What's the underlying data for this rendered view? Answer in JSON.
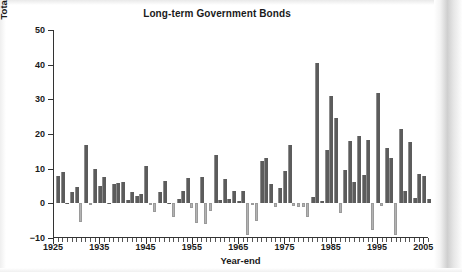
{
  "chart_data": {
    "type": "bar",
    "title": "Long-term Government Bonds",
    "xlabel": "Year-end",
    "ylabel": "Total annual returns (in percent)",
    "ylim": [
      -10,
      50
    ],
    "yticks": [
      -10,
      0,
      10,
      20,
      30,
      40,
      50
    ],
    "ytick_labels": [
      "−10",
      "0",
      "10",
      "20",
      "30",
      "40",
      "50"
    ],
    "xlim": [
      1925,
      2006
    ],
    "xticks": [
      1925,
      1935,
      1945,
      1955,
      1965,
      1975,
      1985,
      1995,
      2005
    ],
    "xtick_labels": [
      "1925",
      "1935",
      "1945",
      "1955",
      "1965",
      "1975",
      "1985",
      "1995",
      "2005"
    ],
    "grid": false,
    "legend": null,
    "bar_color_positive": "#5c5c5c",
    "bar_color_negative": "#b3b3b3",
    "categories": [
      1926,
      1927,
      1928,
      1929,
      1930,
      1931,
      1932,
      1933,
      1934,
      1935,
      1936,
      1937,
      1938,
      1939,
      1940,
      1941,
      1942,
      1943,
      1944,
      1945,
      1946,
      1947,
      1948,
      1949,
      1950,
      1951,
      1952,
      1953,
      1954,
      1955,
      1956,
      1957,
      1958,
      1959,
      1960,
      1961,
      1962,
      1963,
      1964,
      1965,
      1966,
      1967,
      1968,
      1969,
      1970,
      1971,
      1972,
      1973,
      1974,
      1975,
      1976,
      1977,
      1978,
      1979,
      1980,
      1981,
      1982,
      1983,
      1984,
      1985,
      1986,
      1987,
      1988,
      1989,
      1990,
      1991,
      1992,
      1993,
      1994,
      1995,
      1996,
      1997,
      1998,
      1999,
      2000,
      2001,
      2002,
      2003,
      2004,
      2005,
      2006
    ],
    "values": [
      7.8,
      8.9,
      0.1,
      3.4,
      4.7,
      -5.3,
      16.8,
      -0.1,
      10.0,
      5.0,
      7.5,
      0.2,
      5.5,
      5.9,
      6.1,
      0.9,
      3.2,
      2.1,
      2.8,
      10.7,
      -0.1,
      -2.6,
      3.4,
      6.5,
      0.1,
      -3.9,
      1.2,
      3.6,
      7.2,
      -1.3,
      -5.6,
      7.5,
      -6.1,
      -2.3,
      13.8,
      1.0,
      6.9,
      1.2,
      3.5,
      0.7,
      3.7,
      -9.2,
      -0.3,
      -5.1,
      12.1,
      13.2,
      5.7,
      -1.1,
      4.4,
      9.2,
      16.8,
      -0.7,
      -1.2,
      -1.2,
      -4.0,
      1.9,
      40.4,
      0.7,
      15.5,
      31.0,
      24.5,
      -2.7,
      9.7,
      18.1,
      6.2,
      19.3,
      8.1,
      18.2,
      -7.8,
      31.7,
      -0.9,
      15.9,
      13.1,
      -9.0,
      21.5,
      3.7,
      17.8,
      1.4,
      8.5,
      7.8,
      1.2
    ]
  }
}
